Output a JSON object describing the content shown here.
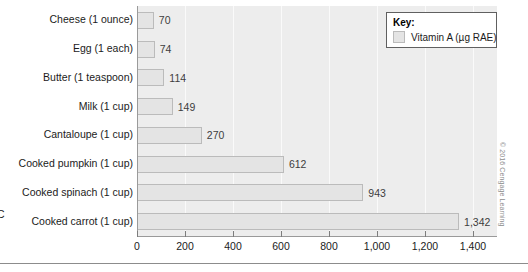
{
  "chart_data": {
    "type": "bar",
    "orientation": "horizontal",
    "title": "",
    "xlabel": "",
    "ylabel": "",
    "xlim": [
      0,
      1500
    ],
    "grid": true,
    "legend_position": "top-right",
    "categories": [
      "Cheese (1 ounce)",
      "Egg (1 each)",
      "Butter (1 teaspoon)",
      "Milk (1 cup)",
      "Cantaloupe (1 cup)",
      "Cooked pumpkin (1 cup)",
      "Cooked spinach (1 cup)",
      "Cooked carrot (1 cup)"
    ],
    "values": [
      70,
      74,
      114,
      149,
      270,
      612,
      943,
      1342
    ],
    "value_labels": [
      "70",
      "74",
      "114",
      "149",
      "270",
      "612",
      "943",
      "1,342"
    ],
    "series": [
      {
        "name": "Vitamin A (µg RAE)",
        "values": [
          70,
          74,
          114,
          149,
          270,
          612,
          943,
          1342
        ]
      }
    ],
    "xticks": [
      0,
      200,
      400,
      600,
      800,
      1000,
      1200,
      1400
    ],
    "xtick_labels": [
      "0",
      "200",
      "400",
      "600",
      "800",
      "1,000",
      "1,200",
      "1,400"
    ],
    "colors": {
      "bar_fill": "#e4e4e4",
      "bar_border": "#bbbbbb",
      "plot_background": "#ededed",
      "axis": "#9a9a9a",
      "gridline": "#fafafa",
      "text": "#1b1b1b"
    }
  },
  "legend": {
    "title": "Key:",
    "entries": [
      {
        "label": "Vitamin A (µg RAE)",
        "swatch_color": "#e4e4e4"
      }
    ]
  },
  "credit": {
    "text": "© 2016 Cengage Learning"
  },
  "edge_artifact": {
    "text": "C"
  }
}
